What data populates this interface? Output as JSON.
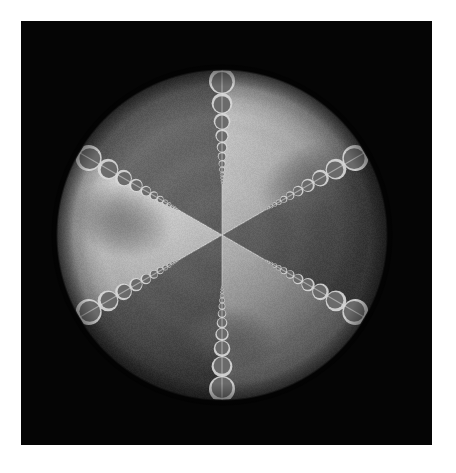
{
  "figure": {
    "title": "",
    "caption": "",
    "canvas": {
      "width": 456,
      "height": 473
    },
    "background_color": "#ffffff"
  },
  "panel": {
    "name": "plot-panel",
    "x": 21,
    "y": 21,
    "width": 411,
    "height": 424,
    "background_color": "#050505",
    "border_color": "#000000"
  },
  "chart_data": {
    "type": "heatmap",
    "title": "",
    "subtitle": "",
    "xlabel": "",
    "ylabel": "",
    "grid": false,
    "legend": "none",
    "colormap": "grayscale",
    "projection": "orthographic-sphere",
    "sphere": {
      "center_x": 222,
      "center_y": 235,
      "radius": 165,
      "base_light": "#b9b9b9",
      "base_dark": "#636363",
      "limb_shadow": "#2a2a2a"
    },
    "sectors": {
      "count": 6,
      "angular_width_deg": 60,
      "start_angle_deg": -90,
      "values": [
        0.82,
        0.38,
        0.84,
        0.36,
        0.86,
        0.34
      ],
      "shades": [
        "#c2c2c2",
        "#6a6a6a",
        "#c6c6c6",
        "#666666",
        "#c9c9c9",
        "#626262"
      ],
      "labels": [
        "S1",
        "S2",
        "S3",
        "S4",
        "S5",
        "S6"
      ]
    },
    "bead_chains": {
      "count": 6,
      "angles_deg": [
        -90,
        -30,
        30,
        90,
        150,
        210
      ],
      "beads_per_chain": 16,
      "scale_ratio": 0.8,
      "bead_fill": "#5c5c5c",
      "bead_rim": "#d8d8d8",
      "min_radius_px": 1.0,
      "max_radius_px": 13.0
    },
    "blobs": [
      {
        "name": "upper-right-blob",
        "cx_deg": -32,
        "r_frac": 0.62,
        "rx": 44,
        "ry": 30,
        "rot_deg": -25,
        "value": 0.27,
        "color": "#7c7c7c"
      },
      {
        "name": "left-blob",
        "cx_deg": 188,
        "r_frac": 0.62,
        "rx": 42,
        "ry": 30,
        "rot_deg": 18,
        "value": 0.26,
        "color": "#787878"
      },
      {
        "name": "lower-right-blob",
        "cx_deg": 86,
        "r_frac": 0.63,
        "rx": 40,
        "ry": 28,
        "rot_deg": 8,
        "value": 0.3,
        "color": "#8a8a8a"
      }
    ],
    "axis_ranges": {
      "x": [
        -1,
        1
      ],
      "y": [
        -1,
        1
      ]
    },
    "value_range": [
      0.0,
      1.0
    ],
    "tick_labels": {
      "x": [],
      "y": []
    },
    "annotations": []
  }
}
